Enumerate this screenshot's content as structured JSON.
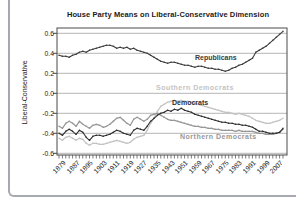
{
  "figure": {
    "title": "House Party Means on Liberal-Conservative Dimension",
    "ylabel": "Liberal-Conservative"
  },
  "chart_data": {
    "type": "line",
    "title": "House Party Means on Liberal-Conservative Dimension",
    "xlabel": "",
    "ylabel": "Liberal-Conservative",
    "xlim": [
      1879,
      2011
    ],
    "ylim": [
      -0.65,
      0.65
    ],
    "grid": true,
    "legend_position": "inline-labels",
    "y_tick_values": [
      0.6,
      0.4,
      0.2,
      0.0,
      -0.2,
      -0.4,
      -0.6
    ],
    "y_tick_labels": [
      "0.6",
      "0.4",
      "0.2",
      "0.0",
      "-0.2",
      "-0.4",
      "-0.6"
    ],
    "x_tick_start": 1879,
    "x_tick_step": 2,
    "x_tick_end": 2011,
    "x_label_step": 8,
    "x_tick_labels": [
      "1879",
      "1887",
      "1895",
      "1903",
      "1911",
      "1919",
      "1927",
      "1935",
      "1943",
      "1951",
      "1959",
      "1967",
      "1975",
      "1983",
      "1991",
      "1999",
      "2007"
    ],
    "series": [
      {
        "name": "Republicans",
        "color": "#3c3c3c",
        "values": [
          0.38,
          0.37,
          0.37,
          0.36,
          0.38,
          0.39,
          0.41,
          0.42,
          0.41,
          0.43,
          0.44,
          0.45,
          0.46,
          0.47,
          0.48,
          0.48,
          0.47,
          0.45,
          0.46,
          0.45,
          0.46,
          0.44,
          0.45,
          0.43,
          0.42,
          0.41,
          0.4,
          0.38,
          0.36,
          0.34,
          0.32,
          0.31,
          0.3,
          0.31,
          0.31,
          0.3,
          0.29,
          0.28,
          0.28,
          0.27,
          0.26,
          0.27,
          0.27,
          0.26,
          0.25,
          0.25,
          0.24,
          0.24,
          0.23,
          0.22,
          0.23,
          0.25,
          0.26,
          0.28,
          0.29,
          0.31,
          0.33,
          0.35,
          0.41,
          0.43,
          0.45,
          0.47,
          0.5,
          0.53,
          0.56,
          0.59,
          0.62
        ]
      },
      {
        "name": "Democrats",
        "color": "#2e2e2e",
        "values": [
          -0.4,
          -0.42,
          -0.38,
          -0.36,
          -0.38,
          -0.41,
          -0.37,
          -0.39,
          -0.44,
          -0.47,
          -0.43,
          -0.42,
          -0.42,
          -0.43,
          -0.42,
          -0.41,
          -0.39,
          -0.37,
          -0.38,
          -0.4,
          -0.41,
          -0.42,
          -0.37,
          -0.35,
          -0.36,
          -0.37,
          -0.33,
          -0.28,
          -0.25,
          -0.22,
          -0.2,
          -0.19,
          -0.17,
          -0.18,
          -0.16,
          -0.17,
          -0.15,
          -0.17,
          -0.18,
          -0.19,
          -0.21,
          -0.22,
          -0.23,
          -0.24,
          -0.25,
          -0.26,
          -0.27,
          -0.28,
          -0.29,
          -0.29,
          -0.3,
          -0.3,
          -0.31,
          -0.31,
          -0.32,
          -0.32,
          -0.33,
          -0.34,
          -0.36,
          -0.38,
          -0.38,
          -0.39,
          -0.4,
          -0.4,
          -0.4,
          -0.39,
          -0.35
        ]
      },
      {
        "name": "Southern Democrats",
        "color": "#c3c3c3",
        "values": [
          -0.45,
          -0.47,
          -0.44,
          -0.43,
          -0.45,
          -0.47,
          -0.45,
          -0.46,
          -0.5,
          -0.52,
          -0.5,
          -0.5,
          -0.51,
          -0.51,
          -0.5,
          -0.49,
          -0.48,
          -0.47,
          -0.48,
          -0.49,
          -0.5,
          -0.49,
          -0.46,
          -0.44,
          -0.43,
          -0.42,
          -0.37,
          -0.3,
          -0.25,
          -0.18,
          -0.13,
          -0.11,
          -0.09,
          -0.08,
          -0.07,
          -0.08,
          -0.07,
          -0.08,
          -0.08,
          -0.09,
          -0.1,
          -0.11,
          -0.12,
          -0.13,
          -0.14,
          -0.15,
          -0.16,
          -0.17,
          -0.18,
          -0.19,
          -0.19,
          -0.2,
          -0.21,
          -0.2,
          -0.21,
          -0.22,
          -0.23,
          -0.25,
          -0.27,
          -0.28,
          -0.29,
          -0.3,
          -0.3,
          -0.29,
          -0.28,
          -0.27,
          -0.25
        ]
      },
      {
        "name": "Northern Democrats",
        "color": "#979797",
        "values": [
          -0.33,
          -0.35,
          -0.3,
          -0.28,
          -0.3,
          -0.33,
          -0.28,
          -0.31,
          -0.33,
          -0.35,
          -0.32,
          -0.31,
          -0.32,
          -0.34,
          -0.33,
          -0.31,
          -0.28,
          -0.25,
          -0.24,
          -0.27,
          -0.3,
          -0.32,
          -0.26,
          -0.24,
          -0.26,
          -0.28,
          -0.26,
          -0.22,
          -0.21,
          -0.2,
          -0.22,
          -0.24,
          -0.26,
          -0.27,
          -0.27,
          -0.28,
          -0.29,
          -0.3,
          -0.31,
          -0.32,
          -0.33,
          -0.33,
          -0.34,
          -0.34,
          -0.35,
          -0.35,
          -0.36,
          -0.36,
          -0.37,
          -0.37,
          -0.37,
          -0.37,
          -0.38,
          -0.37,
          -0.38,
          -0.38,
          -0.38,
          -0.38,
          -0.39,
          -0.4,
          -0.4,
          -0.41,
          -0.41,
          -0.41,
          -0.4,
          -0.39,
          -0.36
        ]
      }
    ],
    "annotations": [
      {
        "text": "Republicans",
        "series": 0
      },
      {
        "text": "Democrats",
        "series": 1
      },
      {
        "text": "Southern Democrats",
        "series": 2
      },
      {
        "text": "Northern Democrats",
        "series": 3
      }
    ],
    "colors": {
      "frame": "#4a4a4a",
      "grid": "#adadad",
      "ticks": "#444444",
      "panel_border": "#a6a9ad",
      "background": "#ffffff"
    }
  }
}
